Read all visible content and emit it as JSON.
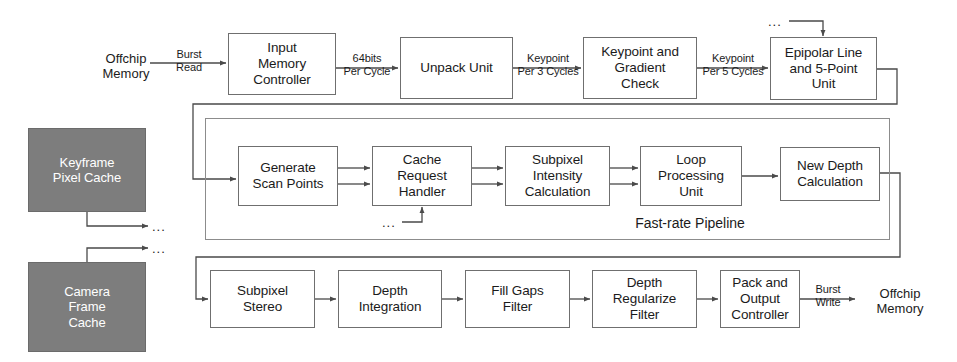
{
  "diagram": {
    "colors": {
      "box_border": "#6f6f6f",
      "box_fill": "#ffffff",
      "cache_fill": "#7d7d7d",
      "cache_text": "#ffffff",
      "wire": "#4a4a4a",
      "text": "#1b1b1b"
    },
    "caches": [
      {
        "id": "keyframe_pixel_cache",
        "label": "Keyframe\nPixel Cache"
      },
      {
        "id": "camera_frame_cache",
        "label": "Camera\nFrame\nCache"
      }
    ],
    "top_row": [
      {
        "id": "input_memory_controller",
        "label": "Input\nMemory\nController"
      },
      {
        "id": "unpack_unit",
        "label": "Unpack Unit"
      },
      {
        "id": "keypoint_gradient_check",
        "label": "Keypoint and\nGradient\nCheck"
      },
      {
        "id": "epipolar_line_5point_unit",
        "label": "Epipolar Line\nand 5-Point\nUnit"
      }
    ],
    "middle_row": [
      {
        "id": "generate_scan_points",
        "label": "Generate\nScan Points"
      },
      {
        "id": "cache_request_handler",
        "label": "Cache\nRequest\nHandler"
      },
      {
        "id": "subpixel_intensity_calculation",
        "label": "Subpixel\nIntensity\nCalculation"
      },
      {
        "id": "loop_processing_unit",
        "label": "Loop\nProcessing\nUnit"
      },
      {
        "id": "new_depth_calculation",
        "label": "New Depth\nCalculation"
      }
    ],
    "bottom_row": [
      {
        "id": "subpixel_stereo",
        "label": "Subpixel\nStereo"
      },
      {
        "id": "depth_integration",
        "label": "Depth\nIntegration"
      },
      {
        "id": "fill_gaps_filter",
        "label": "Fill Gaps\nFilter"
      },
      {
        "id": "depth_regularize_filter",
        "label": "Depth\nRegularize\nFilter"
      },
      {
        "id": "pack_and_output_controller",
        "label": "Pack and\nOutput\nController"
      }
    ],
    "groups": [
      {
        "id": "fast_rate_pipeline",
        "label": "Fast-rate Pipeline"
      }
    ],
    "endpoints": {
      "offchip_memory_in": "Offchip\nMemory",
      "offchip_memory_out": "Offchip\nMemory"
    },
    "edge_labels": {
      "burst_read": "Burst\nRead",
      "bits_per_cycle": "64bits\nPer Cycle",
      "keypoint_per_3_cycles": "Keypoint\nPer 3 Cycles",
      "keypoint_per_5_cycles": "Keypoint\nPer 5 Cycles",
      "burst_write": "Burst\nWrite"
    },
    "ellipses": [
      {
        "id": "ellipsis-keyframe-out",
        "text": "..."
      },
      {
        "id": "ellipsis-camera-out",
        "text": "..."
      },
      {
        "id": "ellipsis-epipolar-in",
        "text": "..."
      },
      {
        "id": "ellipsis-cache-request-in",
        "text": "..."
      }
    ]
  }
}
